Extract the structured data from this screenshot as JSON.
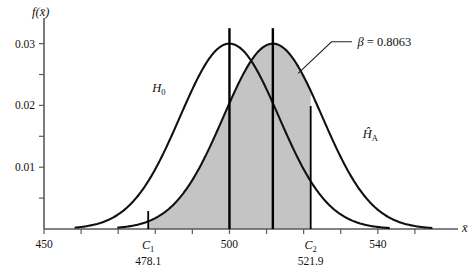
{
  "chart_data": {
    "type": "area",
    "title": "",
    "xlabel": "x̄",
    "ylabel": "f(x̄)",
    "xlim": [
      450,
      560
    ],
    "ylim": [
      0,
      0.0335
    ],
    "grid": false,
    "legend_position": "inline-curve-labels",
    "x_tick_labels": [
      "450",
      "500",
      "540"
    ],
    "x_tick_values": [
      450,
      500,
      540
    ],
    "x_minor_ticks": [
      460,
      470,
      480,
      490,
      510,
      520,
      530,
      550
    ],
    "y_tick_labels": [
      "0.01",
      "0.02",
      "0.03"
    ],
    "y_tick_values": [
      0.01,
      0.02,
      0.03
    ],
    "y_minor_ticks": [
      0.005,
      0.015,
      0.025
    ],
    "series": [
      {
        "name": "H₀",
        "distribution": "normal",
        "mean": 500,
        "std": 13.3,
        "peak": 0.03,
        "filled": false,
        "label": "H",
        "label_subscript": "0",
        "label_x": 481,
        "label_y": 0.0222
      },
      {
        "name": "Ĥₐ",
        "distribution": "normal",
        "mean": 511.7,
        "std": 13.3,
        "peak": 0.03,
        "filled": true,
        "label": "Ĥ",
        "label_subscript": "A",
        "label_x": 538,
        "label_y": 0.0148
      }
    ],
    "shaded_region": {
      "label": "β = 0.8063",
      "symbol": "β",
      "value": 0.8063,
      "value_text": "0.8063",
      "from_x": 478.1,
      "to_x": 521.9,
      "under_series": "Ĥₐ",
      "fill_color": "#c4c4c4"
    },
    "vertical_lines": [
      {
        "name": "mean-h0",
        "x": 500,
        "kind": "mean",
        "top_y": 0.0325
      },
      {
        "name": "mean-ha",
        "x": 511.7,
        "kind": "mean",
        "top_y": 0.0325
      },
      {
        "name": "critical-lower",
        "x": 478.1,
        "kind": "critical",
        "top_y": 0.0029
      },
      {
        "name": "critical-upper",
        "x": 521.9,
        "kind": "critical",
        "top_y": 0.0199
      }
    ],
    "critical_values": [
      {
        "name": "C",
        "subscript": "1",
        "value": 478.1,
        "value_text": "478.1"
      },
      {
        "name": "C",
        "subscript": "2",
        "value": 521.9,
        "value_text": "521.9"
      }
    ],
    "colors": {
      "shade": "#c4c4c4",
      "curve": "#111111",
      "axis": "#5a5a5a",
      "background": "#ffffff"
    }
  }
}
